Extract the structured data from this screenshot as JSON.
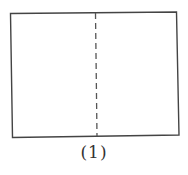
{
  "figure": {
    "label": "(1)",
    "shape": "rectangle",
    "fold_line": "dashed-vertical-center",
    "stroke_color": "#444444",
    "background": "#ffffff"
  }
}
